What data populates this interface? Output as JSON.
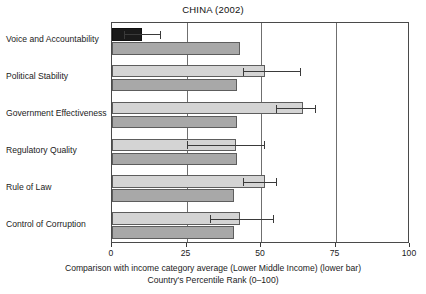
{
  "chart_data": {
    "type": "bar",
    "orientation": "horizontal",
    "title": "CHINA (2002)",
    "xlabel_line1": "Comparison with income category average (Lower Middle Income) (lower bar)",
    "xlabel_line2": "Country's Percentile Rank (0–100)",
    "ylabel": "",
    "xlim": [
      0,
      100
    ],
    "xticks": [
      0,
      25,
      50,
      75,
      100
    ],
    "xtick_labels": [
      "0",
      "25",
      "50",
      "75",
      "100"
    ],
    "grid": true,
    "legend": "none",
    "categories": [
      "Voice and Accountability",
      "Political Stability",
      "Government Effectiveness",
      "Regulatory Quality",
      "Rule of Law",
      "Control of Corruption"
    ],
    "series": [
      {
        "name": "Country's Percentile Rank",
        "role": "upper bar",
        "color": "#d4d4d4",
        "values": [
          10,
          51.5,
          64,
          41.5,
          51.5,
          43
        ],
        "error_low": [
          4,
          44,
          55,
          25,
          44,
          33
        ],
        "error_high": [
          16,
          63,
          68,
          51,
          55,
          54
        ]
      },
      {
        "name": "Lower Middle Income category average",
        "role": "lower bar",
        "color": "#a8a8a8",
        "values": [
          43,
          42,
          42,
          42,
          41,
          41
        ]
      }
    ],
    "highlight": {
      "category": "Voice and Accountability",
      "series": "Country's Percentile Rank",
      "color": "#1a1a1a",
      "note": "bar rendered in near-black"
    }
  },
  "colors": {
    "frame": "#4a4a4a",
    "gridline": "#6f6f6f",
    "bar_upper": "#d4d4d4",
    "bar_lower": "#a8a8a8",
    "bar_highlight": "#1a1a1a",
    "error": "#3a3a3a",
    "text": "#1b1b1b",
    "background": "#ffffff"
  }
}
